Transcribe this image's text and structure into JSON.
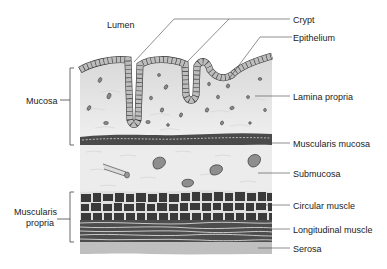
{
  "diagram": {
    "labels": {
      "lumen": "Lumen",
      "crypt": "Crypt",
      "epithelium": "Epithelium",
      "lamina_propria": "Lamina propria",
      "muscularis_mucosa": "Muscularis mucosa",
      "submucosa": "Submucosa",
      "circular_muscle": "Circular muscle",
      "longitudinal_muscle": "Longitudinal muscle",
      "serosa": "Serosa"
    },
    "groups": {
      "mucosa": "Mucosa",
      "muscularis_propria_line1": "Muscularis",
      "muscularis_propria_line2": "propria"
    },
    "colors": {
      "background": "#ffffff",
      "lamina_propria": "#e6e6e6",
      "epithelium_cell": "#bdbdbd",
      "outline": "#333333",
      "muscularis_mucosa": "#4a4a4a",
      "submucosa": "#ececec",
      "vessel": "#8e8e8e",
      "circular_muscle": "#3a3a3a",
      "longitudinal_muscle": "#4d4d4d",
      "serosa": "#bfbfbf",
      "leader_line": "#444444",
      "text": "#222222"
    }
  }
}
